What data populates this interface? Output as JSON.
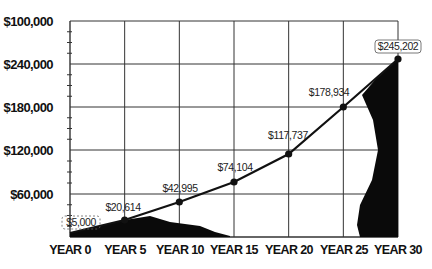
{
  "chart_data": {
    "type": "line",
    "title": "",
    "xlabel": "",
    "ylabel": "",
    "categories": [
      "YEAR 0",
      "YEAR 5",
      "YEAR 10",
      "YEAR 15",
      "YEAR 20",
      "YEAR 25",
      "YEAR 30"
    ],
    "series": [
      {
        "name": "Investment value",
        "values": [
          5000,
          20614,
          42995,
          74104,
          117737,
          178934,
          245202
        ],
        "labels": [
          "$5,000",
          "$20,614",
          "$42,995",
          "$74,104",
          "$117,737",
          "$178,934",
          "$245,202"
        ]
      }
    ],
    "y_tick_labels": [
      "$60,000",
      "$120,000",
      "$180,000",
      "$240,000",
      "$100,000"
    ],
    "y_tick_values": [
      60000,
      120000,
      180000,
      240000,
      300000
    ],
    "ylim": [
      0,
      300000
    ],
    "grid": true,
    "legend": "none",
    "colors": {
      "line": "#111111",
      "grid": "#333333",
      "text": "#111111",
      "fill": "#0a0a0a"
    }
  }
}
